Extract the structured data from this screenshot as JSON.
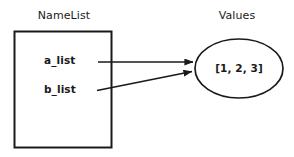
{
  "diagram": {
    "title_left": "NameList",
    "title_right": "Values",
    "namespace_box": {
      "entries": [
        {
          "name": "a_list"
        },
        {
          "name": "b_list"
        }
      ]
    },
    "value_object": {
      "label": "[1, 2, 3]"
    },
    "colors": {
      "stroke": "#1a1a1a",
      "fill": "#ffffff",
      "text": "#1a1a1a",
      "background": "#ffffff"
    },
    "edges": [
      {
        "from": "a_list",
        "to": "[1, 2, 3]"
      },
      {
        "from": "b_list",
        "to": "[1, 2, 3]"
      }
    ]
  }
}
